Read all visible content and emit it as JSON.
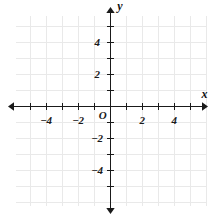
{
  "figure": {
    "kind": "coordinate-plane",
    "origin_label": "O",
    "x_axis_name": "x",
    "y_axis_name": "y",
    "background_color": "#ffffff",
    "grid_color": "#e9e9e9",
    "axis_color": "#1a1a1a",
    "tick_color": "#1a1a1a",
    "label_color": "#1a1a1a"
  },
  "chart_data": {
    "type": "scatter",
    "title": "",
    "subtitle": "",
    "xlabel": "x",
    "ylabel": "y",
    "xlim": [
      -5.9,
      6.0
    ],
    "ylim": [
      -6.2,
      6.4
    ],
    "xticks": [
      -5,
      -4,
      -3,
      -2,
      -1,
      1,
      2,
      3,
      4,
      5
    ],
    "yticks": [
      -5,
      -4,
      -3,
      -2,
      -1,
      1,
      2,
      3,
      4,
      5
    ],
    "xtick_labels": [
      "−4",
      "−2",
      "2",
      "4"
    ],
    "xtick_label_values": [
      -4,
      -2,
      2,
      4
    ],
    "ytick_labels": [
      "4",
      "2",
      "−2",
      "−4"
    ],
    "ytick_label_values": [
      4,
      2,
      -2,
      -4
    ],
    "grid": true,
    "grid_step": 1,
    "legend": null,
    "series": [],
    "x": [],
    "values": [],
    "annotations": [
      {
        "text": "O",
        "x": -0.45,
        "y": -0.55,
        "role": "origin-label"
      },
      {
        "text": "x",
        "x": 5.9,
        "y": 0.72,
        "role": "x-axis-name"
      },
      {
        "text": "y",
        "x": 0.62,
        "y": 6.25,
        "role": "y-axis-name"
      }
    ]
  },
  "geometry": {
    "origin_px": {
      "x": 110,
      "y": 106
    },
    "unit_px": 16,
    "grid_bounds_px": {
      "left": 16,
      "right": 206,
      "top": 16,
      "bottom": 206
    },
    "x_axis_px": {
      "x1": 9,
      "x2": 207,
      "y": 106
    },
    "y_axis_px": {
      "y1": 8,
      "y2": 213,
      "x": 110
    },
    "tick_half_len_px": 3.5
  }
}
